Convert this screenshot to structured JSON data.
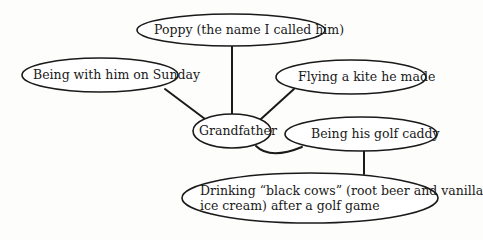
{
  "diagram": {
    "type": "cluster / web diagram",
    "colors": {
      "stroke": "#1a1a1a",
      "fill": "#ffffff",
      "background": "#fdfdfc"
    },
    "center": {
      "id": "grandfather",
      "label": "Grandfather"
    },
    "nodes": [
      {
        "id": "poppy",
        "label": "Poppy (the name I called him)"
      },
      {
        "id": "sunday",
        "label": "Being with him on Sunday"
      },
      {
        "id": "kite",
        "label": "Flying a kite he made"
      },
      {
        "id": "grandfather",
        "label": "Grandfather"
      },
      {
        "id": "caddy",
        "label": "Being his golf caddy"
      },
      {
        "id": "blackcows",
        "label_line1": "Drinking “black cows” (root beer and vanilla",
        "label_line2": "ice cream) after a golf game"
      }
    ],
    "edges": [
      {
        "from": "grandfather",
        "to": "poppy"
      },
      {
        "from": "grandfather",
        "to": "sunday"
      },
      {
        "from": "grandfather",
        "to": "kite"
      },
      {
        "from": "grandfather",
        "to": "caddy"
      },
      {
        "from": "caddy",
        "to": "blackcows"
      }
    ]
  }
}
